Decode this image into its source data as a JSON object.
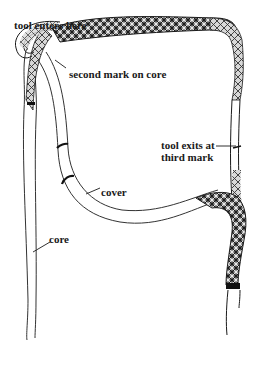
{
  "diagram": {
    "labels": {
      "tool_enters": "tool enters here",
      "second_mark": "second mark on core",
      "tool_exits": "tool exits at\nthird mark",
      "cover": "cover",
      "core": "core"
    },
    "colors": {
      "ink": "#1a1a1a",
      "background": "#ffffff",
      "braid_shade": "#555555"
    }
  }
}
